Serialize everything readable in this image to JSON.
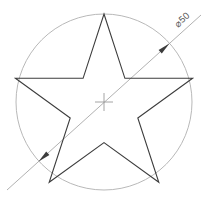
{
  "drawing": {
    "title": "Star inscribed in circle",
    "canvas": {
      "width": 211,
      "height": 205,
      "background": "#ffffff"
    },
    "circle": {
      "name": "construction-circle",
      "center_x": 104,
      "center_y": 102,
      "radius": 88,
      "stroke": "#b0b0b0",
      "stroke_width": 0.9,
      "fill": "none"
    },
    "center_mark": {
      "name": "center-mark",
      "x": 104,
      "y": 102,
      "arm_length": 9,
      "stroke": "#9a9a9a",
      "stroke_width": 0.9
    },
    "star": {
      "name": "five-point-star",
      "points": "104,14 124.9,78.3 192.6,78.3 137.8,118.0 158.8,182.3 104,142.6 49.2,182.3 70.2,118.0 15.4,78.3 83.1,78.3",
      "outer_radius": 88,
      "inner_radius": 41,
      "point_count": 5,
      "stroke": "#3c3c3c",
      "stroke_width": 1.1,
      "fill": "none"
    },
    "dimension": {
      "name": "diameter-dimension",
      "label": "⌀50",
      "value": 50,
      "symbol": "⌀",
      "angle_deg": -42,
      "line": {
        "x1": 7,
        "y1": 190,
        "x2": 201,
        "y2": 15
      },
      "stroke": "#a8a8a8",
      "stroke_width": 0.9,
      "arrow_fill": "#3c3c3c",
      "arrow_start": {
        "x": 38.6,
        "y": 161.5
      },
      "arrow_end": {
        "x": 169.4,
        "y": 43.5
      },
      "label_x": 184,
      "label_y": 22,
      "text_color": "#555555"
    }
  }
}
